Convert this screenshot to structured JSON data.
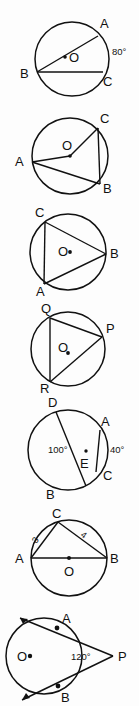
{
  "page": {
    "background_color": "#fdfdfd",
    "ink_color": "#111111",
    "figure_count": 7
  },
  "figures": [
    {
      "id": "figure-1",
      "description": "Circle with center O, chord BC, chord BA, arc AC marked 80 degrees",
      "center_label": "O",
      "points": [
        "A",
        "B",
        "C"
      ],
      "labels": {
        "a": "A",
        "b": "B",
        "c": "C",
        "center": "O",
        "angle": "80°"
      }
    },
    {
      "id": "figure-2",
      "description": "Circle with center O, radii OA and OC, chords AB and CB",
      "center_label": "O",
      "points": [
        "A",
        "B",
        "C"
      ],
      "labels": {
        "a": "A",
        "b": "B",
        "c": "C",
        "center": "O"
      }
    },
    {
      "id": "figure-3",
      "description": "Circle with center O and inscribed triangle CAB",
      "center_label": "O",
      "points": [
        "A",
        "B",
        "C"
      ],
      "labels": {
        "a": "A",
        "b": "B",
        "c": "C",
        "center": "O"
      }
    },
    {
      "id": "figure-4",
      "description": "Circle with center O and inscribed triangle QPR",
      "center_label": "O",
      "points": [
        "P",
        "Q",
        "R"
      ],
      "labels": {
        "p": "P",
        "q": "Q",
        "r": "R",
        "center": "O"
      }
    },
    {
      "id": "figure-5",
      "description": "Circle with chords DB and AC intersecting at interior point E, angle DEA 100 degrees and arc AC 40 degrees",
      "points": [
        "A",
        "B",
        "C",
        "D",
        "E"
      ],
      "labels": {
        "a": "A",
        "b": "B",
        "c": "C",
        "d": "D",
        "e": "E",
        "angle_interior": "100°",
        "angle_exterior": "40°"
      }
    },
    {
      "id": "figure-6",
      "description": "Circle with center O, diameter AB and point C on circle, side AC is 3 and side CB is 4",
      "center_label": "O",
      "points": [
        "A",
        "B",
        "C"
      ],
      "labels": {
        "a": "A",
        "b": "B",
        "c": "C",
        "center": "O",
        "side_ac": "3",
        "side_cb": "4"
      }
    },
    {
      "id": "figure-7",
      "description": "Circle with center O and two tangent lines from external point P touching at A and B, angle APB 120 degrees",
      "center_label": "O",
      "points": [
        "A",
        "B",
        "P"
      ],
      "labels": {
        "a": "A",
        "b": "B",
        "p": "P",
        "center": "O",
        "angle": "120°"
      }
    }
  ]
}
